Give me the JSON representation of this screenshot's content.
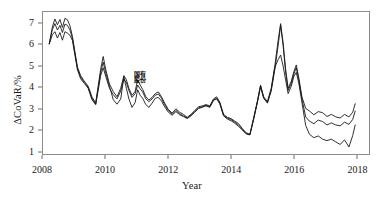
{
  "chart_data": {
    "type": "line",
    "title": "",
    "subtitle": "",
    "xlabel": "Year",
    "ylabel": "ΔCoVaR/%",
    "xlim": [
      2008,
      2018.4
    ],
    "ylim": [
      0.85,
      7.55
    ],
    "grid": false,
    "legend_position": "none",
    "xticks": [
      2008,
      2010,
      2012,
      2014,
      2016,
      2018
    ],
    "xtick_labels": [
      "2008",
      "2010",
      "2012",
      "2014",
      "2016",
      "2018"
    ],
    "yticks": [
      1,
      2,
      3,
      4,
      5,
      6,
      7
    ],
    "ytick_labels": [
      "1",
      "2",
      "3",
      "4",
      "5",
      "6",
      "7"
    ],
    "annotations": [
      {
        "text": "国有\n股份",
        "x": 2011.0,
        "y": 4.45
      }
    ],
    "line_color": "#1a1a1a",
    "frame_color": "#8c8c8c",
    "series": [
      {
        "name": "series-1",
        "x": [
          2008.2,
          2008.3,
          2008.38,
          2008.46,
          2008.54,
          2008.62,
          2008.7,
          2008.78,
          2008.86,
          2008.94,
          2009.02,
          2009.1,
          2009.2,
          2009.32,
          2009.44,
          2009.56,
          2009.68,
          2009.76,
          2009.84,
          2009.92,
          2010.0,
          2010.12,
          2010.24,
          2010.36,
          2010.48,
          2010.58,
          2010.66,
          2010.74,
          2010.84,
          2010.94,
          2011.02,
          2011.1,
          2011.18,
          2011.28,
          2011.38,
          2011.48,
          2011.58,
          2011.68,
          2011.78,
          2011.88,
          2012.0,
          2012.12,
          2012.24,
          2012.36,
          2012.48,
          2012.6,
          2012.72,
          2012.84,
          2012.96,
          2013.08,
          2013.2,
          2013.32,
          2013.44,
          2013.54,
          2013.64,
          2013.76,
          2013.88,
          2014.0,
          2014.12,
          2014.24,
          2014.36,
          2014.48,
          2014.6,
          2014.72,
          2014.84,
          2014.94,
          2015.04,
          2015.16,
          2015.28,
          2015.4,
          2015.5,
          2015.58,
          2015.66,
          2015.74,
          2015.82,
          2015.92,
          2016.0,
          2016.08,
          2016.16,
          2016.26,
          2016.38,
          2016.5,
          2016.64,
          2016.78,
          2016.92,
          2017.06,
          2017.2,
          2017.34,
          2017.48,
          2017.62,
          2017.76,
          2017.88,
          2017.96
        ],
        "y": [
          6.05,
          6.85,
          7.22,
          6.95,
          7.2,
          6.82,
          7.25,
          7.18,
          6.9,
          6.38,
          5.65,
          4.95,
          4.55,
          4.28,
          4.05,
          3.55,
          3.25,
          4.05,
          4.85,
          5.45,
          4.85,
          4.15,
          3.8,
          3.55,
          3.95,
          4.55,
          4.35,
          3.95,
          3.62,
          3.8,
          4.35,
          4.1,
          3.9,
          3.55,
          3.4,
          3.52,
          3.7,
          3.78,
          3.55,
          3.25,
          2.95,
          2.78,
          2.98,
          2.82,
          2.72,
          2.58,
          2.72,
          2.9,
          3.08,
          3.12,
          3.18,
          3.12,
          3.45,
          3.55,
          3.3,
          2.72,
          2.58,
          2.52,
          2.4,
          2.28,
          2.05,
          1.85,
          1.78,
          2.55,
          3.35,
          4.1,
          3.55,
          3.32,
          3.95,
          5.05,
          6.2,
          7.0,
          6.1,
          4.85,
          3.95,
          4.28,
          4.72,
          5.05,
          4.45,
          3.55,
          3.0,
          2.88,
          2.7,
          2.85,
          2.8,
          2.62,
          2.72,
          2.6,
          2.55,
          2.72,
          2.6,
          2.82,
          3.22
        ]
      },
      {
        "name": "series-2",
        "x": [
          2008.2,
          2008.3,
          2008.38,
          2008.46,
          2008.54,
          2008.62,
          2008.7,
          2008.78,
          2008.86,
          2008.94,
          2009.02,
          2009.1,
          2009.2,
          2009.32,
          2009.44,
          2009.56,
          2009.68,
          2009.76,
          2009.84,
          2009.92,
          2010.0,
          2010.12,
          2010.24,
          2010.36,
          2010.48,
          2010.58,
          2010.66,
          2010.74,
          2010.84,
          2010.94,
          2011.02,
          2011.1,
          2011.18,
          2011.28,
          2011.38,
          2011.48,
          2011.58,
          2011.68,
          2011.78,
          2011.88,
          2012.0,
          2012.12,
          2012.24,
          2012.36,
          2012.48,
          2012.6,
          2012.72,
          2012.84,
          2012.96,
          2013.08,
          2013.2,
          2013.32,
          2013.44,
          2013.54,
          2013.64,
          2013.76,
          2013.88,
          2014.0,
          2014.12,
          2014.24,
          2014.36,
          2014.48,
          2014.6,
          2014.72,
          2014.84,
          2014.94,
          2015.04,
          2015.16,
          2015.28,
          2015.4,
          2015.5,
          2015.58,
          2015.66,
          2015.74,
          2015.82,
          2015.92,
          2016.0,
          2016.08,
          2016.16,
          2016.26,
          2016.38,
          2016.5,
          2016.64,
          2016.78,
          2016.92,
          2017.06,
          2017.2,
          2017.34,
          2017.48,
          2017.62,
          2017.76,
          2017.88,
          2017.96
        ],
        "y": [
          6.05,
          6.48,
          6.62,
          6.32,
          6.58,
          6.22,
          6.62,
          6.55,
          6.45,
          6.2,
          5.5,
          4.82,
          4.4,
          4.18,
          3.95,
          3.42,
          3.18,
          3.85,
          4.55,
          4.92,
          4.52,
          3.95,
          3.65,
          3.45,
          3.82,
          4.38,
          4.22,
          3.85,
          3.52,
          3.7,
          4.1,
          3.92,
          3.78,
          3.45,
          3.32,
          3.45,
          3.62,
          3.68,
          3.48,
          3.18,
          2.9,
          2.72,
          2.9,
          2.75,
          2.65,
          2.55,
          2.68,
          2.85,
          3.02,
          3.08,
          3.15,
          3.08,
          3.4,
          3.48,
          3.25,
          2.65,
          2.5,
          2.42,
          2.3,
          2.15,
          1.98,
          1.8,
          1.75,
          2.48,
          3.28,
          4.02,
          3.48,
          3.25,
          3.82,
          4.88,
          5.95,
          6.92,
          5.98,
          4.72,
          3.85,
          4.18,
          4.62,
          4.92,
          4.35,
          3.45,
          2.6,
          2.4,
          2.28,
          2.45,
          2.38,
          2.22,
          2.32,
          2.22,
          2.18,
          2.35,
          2.25,
          2.48,
          2.88
        ]
      },
      {
        "name": "series-3",
        "x": [
          2008.2,
          2008.3,
          2008.38,
          2008.46,
          2008.54,
          2008.62,
          2008.7,
          2008.78,
          2008.86,
          2008.94,
          2009.02,
          2009.1,
          2009.2,
          2009.32,
          2009.44,
          2009.56,
          2009.68,
          2009.76,
          2009.84,
          2009.92,
          2010.0,
          2010.12,
          2010.24,
          2010.36,
          2010.48,
          2010.58,
          2010.66,
          2010.74,
          2010.84,
          2010.94,
          2011.02,
          2011.1,
          2011.18,
          2011.28,
          2011.38,
          2011.48,
          2011.58,
          2011.68,
          2011.78,
          2011.88,
          2012.0,
          2012.12,
          2012.24,
          2012.36,
          2012.48,
          2012.6,
          2012.72,
          2012.84,
          2012.96,
          2013.08,
          2013.2,
          2013.32,
          2013.44,
          2013.54,
          2013.64,
          2013.76,
          2013.88,
          2014.0,
          2014.12,
          2014.24,
          2014.36,
          2014.48,
          2014.6,
          2014.72,
          2014.84,
          2014.94,
          2015.04,
          2015.16,
          2015.28,
          2015.4,
          2015.5,
          2015.58,
          2015.66,
          2015.74,
          2015.82,
          2015.92,
          2016.0,
          2016.08,
          2016.16,
          2016.26,
          2016.38,
          2016.5,
          2016.64,
          2016.78,
          2016.92,
          2017.06,
          2017.2,
          2017.34,
          2017.48,
          2017.62,
          2017.76,
          2017.88,
          2017.96
        ],
        "y": [
          6.05,
          6.72,
          7.0,
          6.7,
          6.92,
          6.58,
          6.98,
          6.92,
          6.7,
          6.3,
          5.58,
          4.88,
          4.48,
          4.22,
          4.0,
          3.48,
          3.2,
          3.95,
          4.7,
          5.18,
          4.68,
          4.05,
          3.42,
          3.2,
          3.45,
          4.5,
          3.95,
          3.45,
          3.05,
          3.28,
          3.88,
          3.62,
          3.48,
          3.18,
          3.05,
          3.25,
          3.48,
          3.52,
          3.35,
          3.08,
          2.82,
          2.68,
          2.85,
          2.7,
          2.62,
          2.52,
          2.65,
          2.82,
          3.0,
          3.05,
          3.12,
          3.05,
          3.38,
          3.45,
          3.22,
          2.68,
          2.55,
          2.48,
          2.35,
          2.22,
          2.02,
          1.82,
          1.76,
          2.52,
          3.32,
          4.06,
          3.5,
          3.28,
          3.88,
          4.95,
          5.3,
          5.52,
          5.0,
          4.35,
          3.7,
          4.05,
          4.5,
          4.7,
          4.2,
          3.3,
          2.2,
          1.78,
          1.62,
          1.7,
          1.55,
          1.48,
          1.55,
          1.42,
          1.3,
          1.52,
          1.18,
          1.72,
          2.22
        ]
      }
    ]
  },
  "axes": {
    "y_title": "ΔCoVaR/%",
    "x_title": "Year"
  }
}
